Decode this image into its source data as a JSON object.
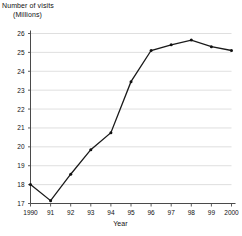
{
  "chart_data": {
    "type": "line",
    "title": "",
    "ylabel": "Number of visits (Millions)",
    "ylabel_line1": "Number of visits",
    "ylabel_line2": "(Millions)",
    "xlabel": "Year",
    "categories": [
      "1990",
      "91",
      "92",
      "93",
      "94",
      "95",
      "96",
      "97",
      "98",
      "99",
      "2000"
    ],
    "values": [
      18.0,
      17.15,
      18.55,
      19.85,
      20.75,
      23.45,
      25.1,
      25.4,
      25.65,
      25.3,
      25.1
    ],
    "x_tick_labels": [
      "1990",
      "91",
      "92",
      "93",
      "94",
      "95",
      "96",
      "97",
      "98",
      "99",
      "2000"
    ],
    "y_tick_labels": [
      "17",
      "18",
      "19",
      "20",
      "21",
      "22",
      "23",
      "24",
      "25",
      "26"
    ],
    "y_tick_values": [
      17,
      18,
      19,
      20,
      21,
      22,
      23,
      24,
      25,
      26
    ],
    "ylim": [
      17,
      26
    ],
    "xlim": [
      1990,
      2000
    ],
    "grid": true,
    "grid_axis": "y",
    "legend": false,
    "legend_position": "none",
    "markers": true,
    "line_color": "#1a1a1a",
    "grid_color": "#bfbfbf",
    "axis_color": "#4a4a4a",
    "background_color": "#ffffff",
    "series": [
      {
        "name": "Number of visits",
        "values": [
          18.0,
          17.15,
          18.55,
          19.85,
          20.75,
          23.45,
          25.1,
          25.4,
          25.65,
          25.3,
          25.1
        ]
      }
    ]
  }
}
